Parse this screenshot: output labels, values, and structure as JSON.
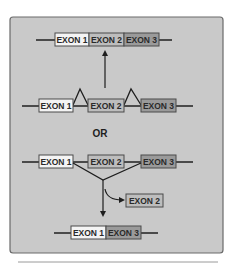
{
  "diagram": {
    "title": "",
    "colors": {
      "panel_fill": "#c9c9c9",
      "panel_border": "#6a6a6a",
      "line": "#4a4a4a",
      "exon1_fill": "#f4f4f4",
      "exon2_fill": "#bdbdbd",
      "exon3_fill": "#9a9a9a",
      "text": "#2a2a2a"
    },
    "top_mrna": {
      "exons": [
        {
          "label": "EXON 1"
        },
        {
          "label": "EXON 2"
        },
        {
          "label": "EXON 3"
        }
      ]
    },
    "pre_mrna_inclusion": {
      "exons": [
        {
          "label": "EXON 1"
        },
        {
          "label": "EXON 2"
        },
        {
          "label": "EXON 3"
        }
      ]
    },
    "or_label": "OR",
    "pre_mrna_skipping": {
      "exons": [
        {
          "label": "EXON 1"
        },
        {
          "label": "EXON 2"
        },
        {
          "label": "EXON 3"
        }
      ]
    },
    "excised_exon": {
      "label": "EXON 2"
    },
    "bottom_mrna": {
      "exons": [
        {
          "label": "EXON 1"
        },
        {
          "label": "EXON 3"
        }
      ]
    }
  }
}
